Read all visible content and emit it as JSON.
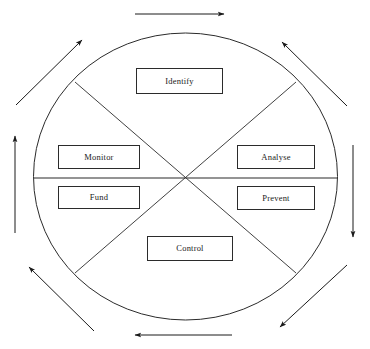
{
  "diagram": {
    "shape": "ellipse",
    "style": {
      "stroke_color": "#2b2b2b",
      "background_color": "#ffffff",
      "text_color": "#1a1a1a"
    },
    "ellipse": {
      "cx": 185.5,
      "cy": 176.5,
      "rx": 152,
      "ry": 143.5
    },
    "center": {
      "x": 185.5,
      "y": 177.5
    },
    "nodes": [
      {
        "id": "identify",
        "label": "Identify",
        "x": 136,
        "y": 68,
        "w": 87,
        "h": 26,
        "sector": "top"
      },
      {
        "id": "analyse",
        "label": "Analyse",
        "x": 237,
        "y": 145,
        "w": 78,
        "h": 24,
        "sector": "upper-right"
      },
      {
        "id": "prevent",
        "label": "Prevent",
        "x": 237,
        "y": 186,
        "w": 78,
        "h": 24,
        "sector": "lower-right"
      },
      {
        "id": "control",
        "label": "Control",
        "x": 147,
        "y": 236,
        "w": 86,
        "h": 25,
        "sector": "bottom"
      },
      {
        "id": "fund",
        "label": "Fund",
        "x": 58,
        "y": 186,
        "w": 82,
        "h": 23,
        "sector": "lower-left"
      },
      {
        "id": "monitor",
        "label": "Monitor",
        "x": 58,
        "y": 145,
        "w": 82,
        "h": 24,
        "sector": "upper-left"
      }
    ],
    "dividers": [
      {
        "id": "divider-horizontal",
        "x1": 34,
        "y1": 178,
        "x2": 338,
        "y2": 178
      },
      {
        "id": "divider-diagonal-nw-se",
        "x1": 75,
        "y1": 82,
        "x2": 296,
        "y2": 273
      },
      {
        "id": "divider-diagonal-ne-sw",
        "x1": 296,
        "y1": 82,
        "x2": 75,
        "y2": 273
      }
    ],
    "flow_arrows": [
      {
        "id": "arrow-top",
        "x1": 135,
        "y1": 14,
        "x2": 226,
        "y2": 14,
        "direction": "right"
      },
      {
        "id": "arrow-top-right",
        "x1": 347,
        "y1": 106,
        "x2": 280,
        "y2": 40,
        "direction": "up-left"
      },
      {
        "id": "arrow-right",
        "x1": 353,
        "y1": 145,
        "x2": 353,
        "y2": 239,
        "direction": "down"
      },
      {
        "id": "arrow-bottom-right",
        "x1": 347,
        "y1": 265,
        "x2": 278,
        "y2": 329,
        "direction": "down-left"
      },
      {
        "id": "arrow-bottom",
        "x1": 232,
        "y1": 335,
        "x2": 133,
        "y2": 335,
        "direction": "left"
      },
      {
        "id": "arrow-bottom-left",
        "x1": 94,
        "y1": 331,
        "x2": 27,
        "y2": 265,
        "direction": "up-left"
      },
      {
        "id": "arrow-left",
        "x1": 15,
        "y1": 233,
        "x2": 15,
        "y2": 134,
        "direction": "up"
      },
      {
        "id": "arrow-top-left",
        "x1": 16,
        "y1": 105,
        "x2": 84,
        "y2": 38,
        "direction": "up-right"
      }
    ]
  }
}
